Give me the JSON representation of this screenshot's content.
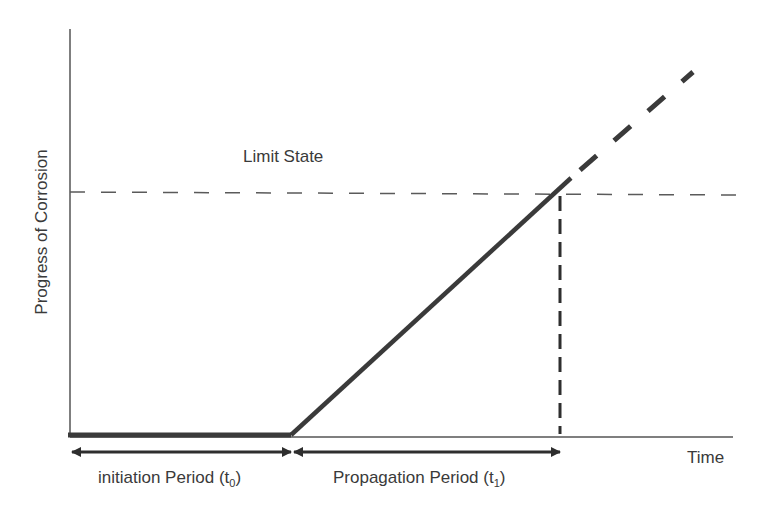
{
  "diagram": {
    "y_axis_label": "Progress of Corrosion",
    "x_axis_label": "Time",
    "limit_state_label": "Limit State",
    "initiation": {
      "text": "initiation Period (t",
      "sub": "0",
      "close": ")"
    },
    "propagation": {
      "text": "Propagation Period (t",
      "sub": "1",
      "close": ")"
    },
    "colors": {
      "line": "#3a3a3a",
      "axis": "#555555",
      "dash": "#5a5a5a"
    }
  }
}
